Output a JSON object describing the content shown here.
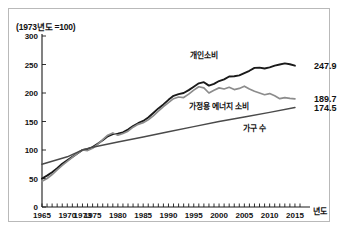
{
  "figure": {
    "unit_note": "(1973년도 =100)",
    "x_axis_unit": "년도"
  },
  "chart_data": {
    "type": "line",
    "title": "(1973년도 =100)",
    "xlabel": "년도",
    "ylabel": "",
    "xlim": [
      1965,
      2016
    ],
    "ylim": [
      0,
      300
    ],
    "yticks": [
      0,
      50,
      100,
      150,
      200,
      250,
      300
    ],
    "xticks": [
      1965,
      1970,
      1973,
      1975,
      1980,
      1985,
      1990,
      1995,
      2000,
      2005,
      2010,
      2015
    ],
    "grid": false,
    "legend_position": "inline-annotations",
    "series": [
      {
        "name": "개인소비",
        "color": "#1a1a1a",
        "end_label": "247.9",
        "x": [
          1965,
          1966,
          1967,
          1968,
          1969,
          1970,
          1971,
          1972,
          1973,
          1974,
          1975,
          1976,
          1977,
          1978,
          1979,
          1980,
          1981,
          1982,
          1983,
          1984,
          1985,
          1986,
          1987,
          1988,
          1989,
          1990,
          1991,
          1992,
          1993,
          1994,
          1995,
          1996,
          1997,
          1998,
          1999,
          2000,
          2001,
          2002,
          2003,
          2004,
          2005,
          2006,
          2007,
          2008,
          2009,
          2010,
          2011,
          2012,
          2013,
          2014,
          2015
        ],
        "values": [
          50.0,
          55.0,
          61.0,
          68.0,
          76.0,
          82.0,
          88.0,
          94.0,
          100.0,
          101.5,
          105.0,
          111.0,
          117.0,
          124.0,
          128.0,
          128.5,
          131.0,
          136.0,
          142.0,
          147.0,
          151.0,
          157.0,
          165.0,
          173.0,
          180.0,
          188.0,
          195.0,
          198.0,
          200.0,
          205.0,
          211.0,
          217.0,
          219.0,
          213.0,
          216.0,
          221.0,
          224.0,
          229.0,
          229.5,
          231.0,
          235.0,
          239.0,
          244.0,
          244.5,
          243.0,
          245.0,
          248.0,
          250.0,
          252.0,
          250.5,
          247.9
        ]
      },
      {
        "name": "가정용 에너지 소비",
        "color": "#8c8c8c",
        "end_label": "189.7",
        "x": [
          1965,
          1966,
          1967,
          1968,
          1969,
          1970,
          1971,
          1972,
          1973,
          1974,
          1975,
          1976,
          1977,
          1978,
          1979,
          1980,
          1981,
          1982,
          1983,
          1984,
          1985,
          1986,
          1987,
          1988,
          1989,
          1990,
          1991,
          1992,
          1993,
          1994,
          1995,
          1996,
          1997,
          1998,
          1999,
          2000,
          2001,
          2002,
          2003,
          2004,
          2005,
          2006,
          2007,
          2008,
          2009,
          2010,
          2011,
          2012,
          2013,
          2014,
          2015
        ],
        "values": [
          45.0,
          50.0,
          57.0,
          65.0,
          73.0,
          80.0,
          87.0,
          94.0,
          100.0,
          99.0,
          103.0,
          110.0,
          118.0,
          126.0,
          130.0,
          126.0,
          129.0,
          133.0,
          140.0,
          145.0,
          148.0,
          153.0,
          160.0,
          168.0,
          176.0,
          183.0,
          190.0,
          193.0,
          192.0,
          198.0,
          205.0,
          211.0,
          209.0,
          200.0,
          205.0,
          209.0,
          207.0,
          210.0,
          206.0,
          208.0,
          212.0,
          207.0,
          203.0,
          200.0,
          197.0,
          199.0,
          195.0,
          190.0,
          192.0,
          190.5,
          189.7
        ]
      },
      {
        "name": "가구 수",
        "color": "#4a4a4a",
        "end_label": "174.5",
        "x": [
          1965,
          1970,
          1973,
          1975,
          1980,
          1985,
          1990,
          1995,
          2000,
          2005,
          2010,
          2015
        ],
        "values": [
          75.0,
          88.0,
          100.0,
          105.0,
          114.0,
          123.0,
          132.0,
          141.0,
          150.0,
          158.0,
          166.0,
          174.5
        ]
      }
    ]
  },
  "annotations": [
    {
      "name": "개인소비",
      "x": 1997,
      "y": 262
    },
    {
      "name": "가정용 에너지 소비",
      "x": 2000,
      "y": 172
    },
    {
      "name": "가구 수",
      "x": 2007,
      "y": 134
    }
  ]
}
